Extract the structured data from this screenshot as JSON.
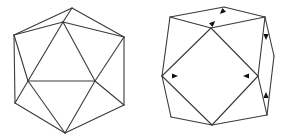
{
  "figures": [
    {
      "id": "icosahedron",
      "label": "",
      "stroke_color": "#3a3a3a",
      "vertices": {
        "top": [
          72,
          8
        ],
        "upper_inner": [
          63,
          22
        ],
        "upper_left": [
          14,
          35
        ],
        "upper_right": [
          124,
          37
        ],
        "mid_left": [
          28,
          81
        ],
        "mid_right": [
          95,
          81
        ],
        "lower_left": [
          15,
          103
        ],
        "lower_right": [
          124,
          105
        ],
        "bottom": [
          65,
          133
        ]
      },
      "edges": [
        [
          "top",
          "upper_left"
        ],
        [
          "top",
          "upper_right"
        ],
        [
          "top",
          "upper_inner"
        ],
        [
          "upper_inner",
          "upper_left"
        ],
        [
          "upper_inner",
          "upper_right"
        ],
        [
          "upper_inner",
          "mid_left"
        ],
        [
          "upper_inner",
          "mid_right"
        ],
        [
          "upper_left",
          "lower_left"
        ],
        [
          "upper_left",
          "mid_left"
        ],
        [
          "upper_right",
          "lower_right"
        ],
        [
          "upper_right",
          "mid_right"
        ],
        [
          "mid_left",
          "mid_right"
        ],
        [
          "mid_left",
          "lower_left"
        ],
        [
          "mid_left",
          "bottom"
        ],
        [
          "mid_right",
          "lower_right"
        ],
        [
          "mid_right",
          "bottom"
        ],
        [
          "lower_left",
          "bottom"
        ],
        [
          "lower_right",
          "bottom"
        ]
      ]
    },
    {
      "id": "collapsed-polyhedron",
      "label": "",
      "stroke_color": "#3a3a3a",
      "arrow_color": "#111111",
      "vertices": {
        "top_left": [
          170,
          17
        ],
        "top_center": [
          224,
          7
        ],
        "top_right": [
          265,
          17
        ],
        "sq_top": [
          211,
          28
        ],
        "sq_left": [
          162,
          76
        ],
        "sq_right": [
          258,
          76
        ],
        "far_right": [
          274,
          56
        ],
        "lower_right": [
          267,
          115
        ],
        "bottom_left": [
          171,
          117
        ],
        "sq_bottom": [
          212,
          125
        ]
      },
      "edges": [
        [
          "top_left",
          "top_center"
        ],
        [
          "top_center",
          "top_right"
        ],
        [
          "top_left",
          "sq_top"
        ],
        [
          "sq_top",
          "top_right"
        ],
        [
          "top_left",
          "sq_left"
        ],
        [
          "sq_top",
          "sq_left"
        ],
        [
          "sq_top",
          "sq_right"
        ],
        [
          "top_right",
          "sq_right"
        ],
        [
          "top_right",
          "far_right"
        ],
        [
          "far_right",
          "lower_right"
        ],
        [
          "sq_right",
          "lower_right"
        ],
        [
          "sq_left",
          "sq_bottom"
        ],
        [
          "sq_right",
          "sq_bottom"
        ],
        [
          "sq_left",
          "bottom_left"
        ],
        [
          "bottom_left",
          "sq_bottom"
        ],
        [
          "sq_bottom",
          "lower_right"
        ]
      ],
      "arrows": [
        {
          "name": "arrow-top-down-left",
          "at": [
            222,
            12
          ],
          "direction": "down-left"
        },
        {
          "name": "arrow-top-up-right",
          "at": [
            213,
            23
          ],
          "direction": "up-right"
        },
        {
          "name": "arrow-right-edge-down",
          "at": [
            266,
            37
          ],
          "direction": "down"
        },
        {
          "name": "arrow-right-edge-up",
          "at": [
            266,
            95
          ],
          "direction": "up"
        },
        {
          "name": "arrow-left-vertex-right",
          "at": [
            175,
            76
          ],
          "direction": "right"
        },
        {
          "name": "arrow-right-vertex-left",
          "at": [
            246,
            76
          ],
          "direction": "left"
        }
      ]
    }
  ]
}
